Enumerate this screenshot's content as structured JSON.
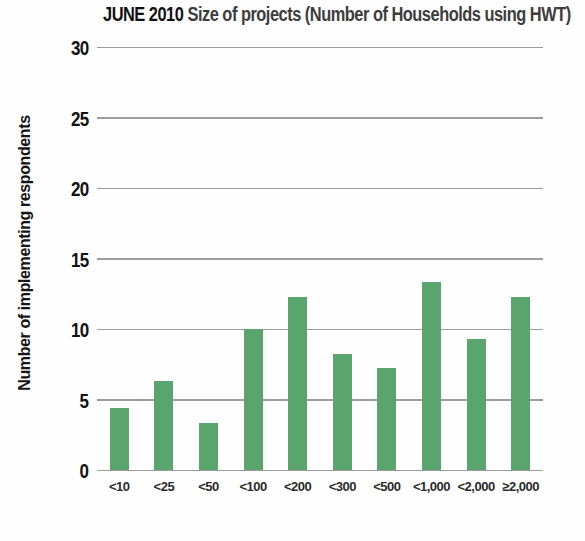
{
  "title": {
    "prefix": "JUNE 2010",
    "rest": "Size of projects (Number of Households using HWT)"
  },
  "chart_data": {
    "type": "bar",
    "categories": [
      "<10",
      "<25",
      "<50",
      "<100",
      "<200",
      "<300",
      "<500",
      "<1,000",
      "<2,000",
      "≥2,000"
    ],
    "values": [
      4.4,
      6.3,
      3.3,
      10.0,
      12.3,
      8.2,
      7.2,
      13.3,
      9.3,
      12.3
    ],
    "xlabel": "",
    "ylabel": "Number of implementing respondents",
    "ylim": [
      0,
      30
    ],
    "yticks": [
      0,
      5,
      10,
      15,
      20,
      25,
      30
    ],
    "grid": true,
    "legend": false,
    "colors": {
      "bar": "#5aa46e",
      "gridline": "#9c9c9c",
      "title_primary": "#111111",
      "title_secondary": "#3d3d3d",
      "text": "#2b2b2b",
      "background": "#fefefe"
    }
  }
}
